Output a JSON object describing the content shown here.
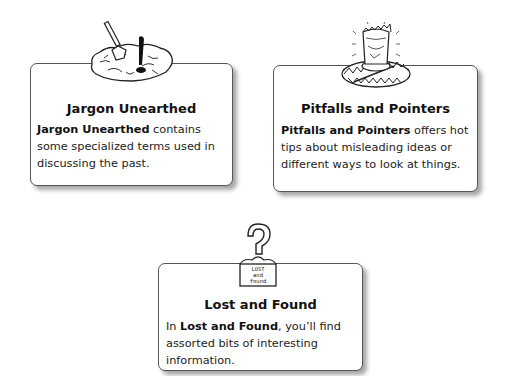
{
  "cards": [
    {
      "title": "Jargon Unearthed",
      "body_bold": "Jargon Unearthed",
      "body_rest": " contains some specialized terms used in discussing the past.",
      "icon": "dig-site-icon"
    },
    {
      "title": "Pitfalls and Pointers",
      "body_bold": "Pitfalls and Pointers",
      "body_rest": " offers hot tips about misleading ideas or different ways to look at things.",
      "icon": "bear-trap-icon"
    },
    {
      "title": "Lost and Found",
      "body_pre": "In ",
      "body_bold": "Lost and Found",
      "body_rest": ", you’ll find assorted bits of interesting information.",
      "icon": "lost-and-found-box-icon",
      "box_label": [
        "LOST",
        "and",
        "found"
      ]
    }
  ]
}
